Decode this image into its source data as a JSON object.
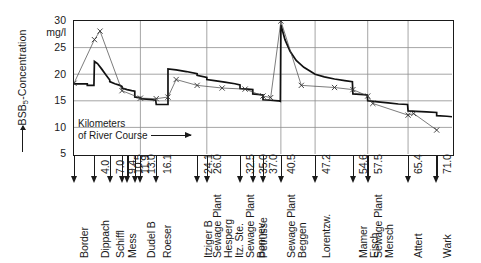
{
  "chart_data": {
    "type": "line",
    "title": "",
    "ylabel": "BSB5-Concentration",
    "yunit": "mg/l",
    "xlabel": "Kilometers of River Course",
    "xlabel_line1": "Kilometers",
    "xlabel_line2": "of River Course",
    "ylim": [
      5,
      30
    ],
    "yticks": [
      5,
      10,
      15,
      20,
      25,
      30
    ],
    "xlim": [
      0,
      74
    ],
    "grid": true,
    "grid_x_positions": [
      13.0,
      26.0,
      40.5,
      47.2,
      57.5,
      65.4
    ],
    "legend": "none",
    "stations": [
      {
        "km": 0.0,
        "km_label": "",
        "name": "Border"
      },
      {
        "km": 4.0,
        "km_label": "4.0",
        "name": "Dippach"
      },
      {
        "km": 7.0,
        "km_label": "7.0",
        "name": "Schiffl"
      },
      {
        "km": 9.4,
        "km_label": "9.4",
        "name": "Mess"
      },
      {
        "km": 10.5,
        "km_label": "10.5",
        "name": ""
      },
      {
        "km": 11.9,
        "km_label": "11.9",
        "name": ""
      },
      {
        "km": 13.0,
        "km_label": "13.0",
        "name": "Dudel B"
      },
      {
        "km": 16.1,
        "km_label": "16.1",
        "name": "Roeser"
      },
      {
        "km": 24.1,
        "km_label": "24.1",
        "name": "Itziger B"
      },
      {
        "km": 26.0,
        "km_label": "26.0",
        "name": "Sewage Plant Hesperg Itz. Ste."
      },
      {
        "km": 32.5,
        "km_label": "32.5",
        "name": "Sewage Plant Bonnev"
      },
      {
        "km": 35.0,
        "km_label": "35.0",
        "name": "Petrusse"
      },
      {
        "km": 37.0,
        "km_label": "37.0",
        "name": ""
      },
      {
        "km": 40.5,
        "km_label": "40.5",
        "name": "Sewage Plant Beggen"
      },
      {
        "km": 47.2,
        "km_label": "47.2",
        "name": "Lorentzw."
      },
      {
        "km": 54.6,
        "km_label": "54.6",
        "name": "Mamer Eisch"
      },
      {
        "km": 57.5,
        "km_label": "57.5",
        "name": "Sewage Plant Mersch"
      },
      {
        "km": 65.4,
        "km_label": "65.4",
        "name": "Attert"
      },
      {
        "km": 71.0,
        "km_label": "71.0",
        "name": "Wark"
      }
    ],
    "series": [
      {
        "name": "simulated",
        "style": "thick-step",
        "points": [
          [
            0.0,
            18.2
          ],
          [
            2.6,
            18.2
          ],
          [
            2.6,
            17.9
          ],
          [
            3.9,
            17.9
          ],
          [
            4.0,
            22.4
          ],
          [
            4.6,
            22.0
          ],
          [
            5.4,
            21.0
          ],
          [
            6.3,
            19.8
          ],
          [
            7.0,
            18.9
          ],
          [
            7.0,
            18.6
          ],
          [
            8.0,
            18.2
          ],
          [
            9.0,
            17.9
          ],
          [
            9.4,
            17.7
          ],
          [
            9.4,
            17.4
          ],
          [
            10.4,
            17.1
          ],
          [
            11.3,
            16.9
          ],
          [
            11.9,
            16.8
          ],
          [
            11.9,
            15.7
          ],
          [
            12.6,
            15.6
          ],
          [
            13.0,
            15.6
          ],
          [
            13.0,
            15.4
          ],
          [
            14.2,
            15.3
          ],
          [
            15.4,
            15.2
          ],
          [
            16.0,
            15.1
          ],
          [
            16.1,
            14.3
          ],
          [
            17.0,
            14.3
          ],
          [
            18.0,
            14.3
          ],
          [
            18.4,
            14.3
          ],
          [
            18.4,
            21.0
          ],
          [
            20.0,
            20.8
          ],
          [
            22.0,
            20.5
          ],
          [
            24.1,
            20.1
          ],
          [
            24.1,
            19.8
          ],
          [
            26.0,
            19.4
          ],
          [
            26.0,
            19.0
          ],
          [
            27.5,
            18.8
          ],
          [
            29.5,
            18.5
          ],
          [
            31.5,
            18.2
          ],
          [
            32.5,
            18.0
          ],
          [
            32.5,
            17.3
          ],
          [
            34.0,
            17.2
          ],
          [
            35.0,
            17.1
          ],
          [
            35.0,
            16.3
          ],
          [
            36.0,
            16.2
          ],
          [
            37.0,
            16.1
          ],
          [
            37.0,
            15.2
          ],
          [
            38.5,
            15.1
          ],
          [
            40.0,
            15.0
          ],
          [
            40.4,
            14.9
          ],
          [
            40.5,
            29.3
          ],
          [
            41.3,
            26.5
          ],
          [
            42.3,
            24.3
          ],
          [
            43.5,
            22.6
          ],
          [
            45.0,
            21.3
          ],
          [
            46.5,
            20.4
          ],
          [
            47.2,
            20.0
          ],
          [
            49.0,
            19.5
          ],
          [
            51.0,
            19.1
          ],
          [
            53.0,
            18.8
          ],
          [
            54.5,
            18.6
          ],
          [
            54.6,
            16.3
          ],
          [
            56.0,
            16.2
          ],
          [
            57.4,
            16.1
          ],
          [
            57.5,
            15.0
          ],
          [
            59.5,
            14.8
          ],
          [
            61.5,
            14.6
          ],
          [
            63.5,
            14.4
          ],
          [
            65.3,
            14.3
          ],
          [
            65.4,
            13.1
          ],
          [
            67.0,
            13.0
          ],
          [
            69.0,
            12.9
          ],
          [
            71.0,
            12.8
          ],
          [
            71.0,
            12.2
          ],
          [
            73.0,
            12.1
          ],
          [
            74.0,
            12.0
          ]
        ]
      },
      {
        "name": "measured",
        "style": "thin-marker",
        "marker": "x",
        "points": [
          [
            0.0,
            18.3
          ],
          [
            4.0,
            26.5
          ],
          [
            5.1,
            28.1
          ],
          [
            9.4,
            16.9
          ],
          [
            13.0,
            15.5
          ],
          [
            16.1,
            15.4
          ],
          [
            18.4,
            15.7
          ],
          [
            20.0,
            19.0
          ],
          [
            24.1,
            17.9
          ],
          [
            29.0,
            17.4
          ],
          [
            33.5,
            17.2
          ],
          [
            37.0,
            15.9
          ],
          [
            38.5,
            15.6
          ],
          [
            40.5,
            30.0
          ],
          [
            44.5,
            17.9
          ],
          [
            51.0,
            17.5
          ],
          [
            54.6,
            17.1
          ],
          [
            57.5,
            15.9
          ],
          [
            58.5,
            14.5
          ],
          [
            65.4,
            12.3
          ],
          [
            66.5,
            12.6
          ],
          [
            71.0,
            9.5
          ]
        ]
      }
    ]
  }
}
